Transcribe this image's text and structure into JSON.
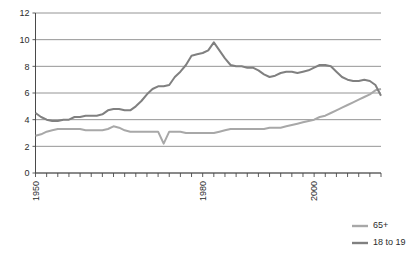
{
  "chart_data": {
    "type": "line",
    "title": "",
    "subtitle": "",
    "xlabel": "",
    "ylabel": "",
    "xlim": [
      1950,
      2012
    ],
    "ylim": [
      0,
      12
    ],
    "yticks": [
      0,
      2,
      4,
      6,
      8,
      10,
      12
    ],
    "xticks_labeled": [
      1950,
      1980,
      2000
    ],
    "xtick_interval": 2,
    "grid": true,
    "grid_axis": "y",
    "legend_position": "bottom-right",
    "colors": {
      "65+": "#a8a8a8",
      "18 to 19": "#808080",
      "grid": "#7a7a7a",
      "axis": "#4a4a4a",
      "text": "#2b2b2b",
      "background": "#ffffff"
    },
    "x": [
      1950,
      1951,
      1952,
      1953,
      1954,
      1955,
      1956,
      1957,
      1958,
      1959,
      1960,
      1961,
      1962,
      1963,
      1964,
      1965,
      1966,
      1967,
      1968,
      1969,
      1970,
      1971,
      1972,
      1973,
      1974,
      1975,
      1976,
      1977,
      1978,
      1979,
      1980,
      1981,
      1982,
      1983,
      1984,
      1985,
      1986,
      1987,
      1988,
      1989,
      1990,
      1991,
      1992,
      1993,
      1994,
      1995,
      1996,
      1997,
      1998,
      1999,
      2000,
      2001,
      2002,
      2003,
      2004,
      2005,
      2006,
      2007,
      2008,
      2009,
      2010,
      2011,
      2012
    ],
    "series": [
      {
        "name": "65+",
        "color": "#a8a8a8",
        "values": [
          2.8,
          2.9,
          3.1,
          3.2,
          3.3,
          3.3,
          3.3,
          3.3,
          3.3,
          3.2,
          3.2,
          3.2,
          3.2,
          3.3,
          3.5,
          3.4,
          3.2,
          3.1,
          3.1,
          3.1,
          3.1,
          3.1,
          3.1,
          2.2,
          3.1,
          3.1,
          3.1,
          3.0,
          3.0,
          3.0,
          3.0,
          3.0,
          3.0,
          3.1,
          3.2,
          3.3,
          3.3,
          3.3,
          3.3,
          3.3,
          3.3,
          3.3,
          3.4,
          3.4,
          3.4,
          3.5,
          3.6,
          3.7,
          3.8,
          3.9,
          4.0,
          4.2,
          4.3,
          4.5,
          4.7,
          4.9,
          5.1,
          5.3,
          5.5,
          5.7,
          5.9,
          6.2,
          6.3
        ]
      },
      {
        "name": "18 to 19",
        "color": "#808080",
        "values": [
          4.5,
          4.2,
          4.0,
          3.9,
          3.9,
          4.0,
          4.0,
          4.2,
          4.2,
          4.3,
          4.3,
          4.3,
          4.4,
          4.7,
          4.8,
          4.8,
          4.7,
          4.7,
          5.0,
          5.4,
          5.9,
          6.3,
          6.5,
          6.5,
          6.6,
          7.2,
          7.6,
          8.1,
          8.8,
          8.9,
          9.0,
          9.2,
          9.8,
          9.2,
          8.6,
          8.1,
          8.0,
          8.0,
          7.9,
          7.9,
          7.7,
          7.4,
          7.2,
          7.3,
          7.5,
          7.6,
          7.6,
          7.5,
          7.6,
          7.7,
          7.9,
          8.1,
          8.1,
          8.0,
          7.6,
          7.2,
          7.0,
          6.9,
          6.9,
          7.0,
          6.9,
          6.6,
          5.8
        ]
      }
    ],
    "legend": [
      {
        "label": "65+",
        "color": "#a8a8a8"
      },
      {
        "label": "18 to 19",
        "color": "#808080"
      }
    ],
    "ytick_labels": [
      "0",
      "2",
      "4",
      "6",
      "8",
      "10",
      "12"
    ],
    "xtick_labels": [
      "1950",
      "1980",
      "2000"
    ]
  }
}
